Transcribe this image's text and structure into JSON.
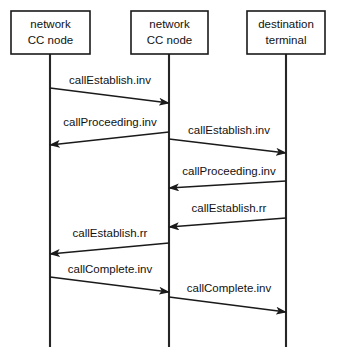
{
  "diagram": {
    "type": "sequence-diagram",
    "width": 337,
    "height": 359,
    "background_color": "#ffffff",
    "line_color": "#1a1a1a",
    "participants": [
      {
        "id": "origin-network-cc-node",
        "line1": "network",
        "line2": "CC node",
        "box": {
          "x": 11,
          "y": 11,
          "width": 79,
          "height": 43
        },
        "lifeline_x": 50,
        "lifeline_top": 54,
        "lifeline_bottom": 347
      },
      {
        "id": "transit-network-cc-node",
        "line1": "network",
        "line2": "CC node",
        "box": {
          "x": 131,
          "y": 11,
          "width": 77,
          "height": 43
        },
        "lifeline_x": 169,
        "lifeline_top": 54,
        "lifeline_bottom": 347
      },
      {
        "id": "destination-terminal",
        "line1": "destination",
        "line2": "terminal",
        "box": {
          "x": 247,
          "y": 11,
          "width": 78,
          "height": 43
        },
        "lifeline_x": 286,
        "lifeline_top": 54,
        "lifeline_bottom": 347
      }
    ],
    "messages": [
      {
        "id": "msg-1",
        "label": "callEstablish.inv",
        "from": 0,
        "to": 1,
        "direction": "right",
        "x1": 50,
        "y1": 88,
        "x2": 169,
        "y2": 103,
        "label_x": 110,
        "label_y": 84
      },
      {
        "id": "msg-2",
        "label": "callProceeding.inv",
        "from": 1,
        "to": 0,
        "direction": "left",
        "x1": 169,
        "y1": 132,
        "x2": 50,
        "y2": 145,
        "label_x": 110,
        "label_y": 126
      },
      {
        "id": "msg-3",
        "label": "callEstablish.inv",
        "from": 1,
        "to": 2,
        "direction": "right",
        "x1": 169,
        "y1": 139,
        "x2": 286,
        "y2": 153,
        "label_x": 229,
        "label_y": 134
      },
      {
        "id": "msg-4",
        "label": "callProceeding.inv",
        "from": 2,
        "to": 1,
        "direction": "left",
        "x1": 286,
        "y1": 181,
        "x2": 169,
        "y2": 188,
        "label_x": 229,
        "label_y": 175
      },
      {
        "id": "msg-5",
        "label": "callEstablish.rr",
        "from": 2,
        "to": 1,
        "direction": "left",
        "x1": 286,
        "y1": 218,
        "x2": 169,
        "y2": 227,
        "label_x": 229,
        "label_y": 212
      },
      {
        "id": "msg-6",
        "label": "callEstablish.rr",
        "from": 1,
        "to": 0,
        "direction": "left",
        "x1": 169,
        "y1": 243,
        "x2": 50,
        "y2": 254,
        "label_x": 110,
        "label_y": 237
      },
      {
        "id": "msg-7",
        "label": "callComplete.inv",
        "from": 0,
        "to": 1,
        "direction": "right",
        "x1": 50,
        "y1": 277,
        "x2": 169,
        "y2": 292,
        "label_x": 110,
        "label_y": 273
      },
      {
        "id": "msg-8",
        "label": "callComplete.inv",
        "from": 1,
        "to": 2,
        "direction": "right",
        "x1": 169,
        "y1": 297,
        "x2": 286,
        "y2": 312,
        "label_x": 229,
        "label_y": 292
      }
    ]
  }
}
